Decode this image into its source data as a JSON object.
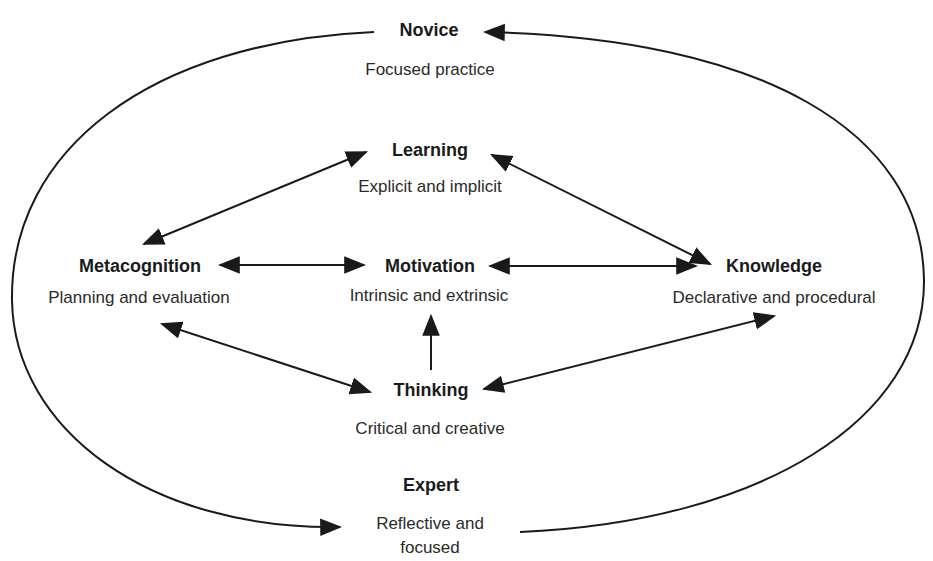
{
  "diagram": {
    "type": "cycle-with-network",
    "outer_cycle": {
      "start": {
        "title": "Novice",
        "subtitle": "Focused practice"
      },
      "end": {
        "title": "Expert",
        "subtitle_line1": "Reflective and",
        "subtitle_line2": "focused"
      }
    },
    "nodes": {
      "learning": {
        "title": "Learning",
        "subtitle": "Explicit and implicit"
      },
      "metacognition": {
        "title": "Metacognition",
        "subtitle": "Planning and evaluation"
      },
      "motivation": {
        "title": "Motivation",
        "subtitle": "Intrinsic and extrinsic"
      },
      "knowledge": {
        "title": "Knowledge",
        "subtitle": "Declarative and procedural"
      },
      "thinking": {
        "title": "Thinking",
        "subtitle": "Critical and creative"
      }
    },
    "edges": [
      {
        "from": "Learning",
        "to": "Metacognition",
        "direction": "both"
      },
      {
        "from": "Learning",
        "to": "Knowledge",
        "direction": "both"
      },
      {
        "from": "Metacognition",
        "to": "Motivation",
        "direction": "both"
      },
      {
        "from": "Motivation",
        "to": "Knowledge",
        "direction": "both"
      },
      {
        "from": "Metacognition",
        "to": "Thinking",
        "direction": "both"
      },
      {
        "from": "Knowledge",
        "to": "Thinking",
        "direction": "both"
      },
      {
        "from": "Thinking",
        "to": "Motivation",
        "direction": "forward"
      },
      {
        "from": "Novice",
        "to": "Expert",
        "direction": "forward",
        "path": "outer-left-arc"
      },
      {
        "from": "Expert",
        "to": "Novice",
        "direction": "forward",
        "path": "outer-right-arc"
      }
    ],
    "line_color": "#1a1a1a"
  }
}
